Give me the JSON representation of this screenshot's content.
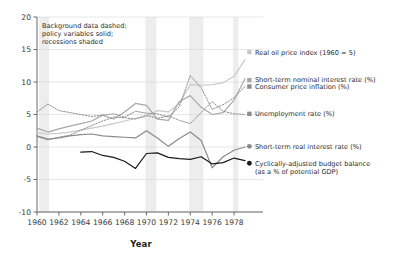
{
  "chart_data": {
    "type": "line",
    "title": "",
    "xlabel": "Year",
    "ylabel": "",
    "xlim": [
      1960,
      1979
    ],
    "ylim": [
      -10,
      20
    ],
    "xticks": [
      1960,
      1962,
      1964,
      1966,
      1968,
      1970,
      1972,
      1974,
      1976,
      1978
    ],
    "yticks": [
      -10,
      -5,
      0,
      5,
      10,
      15,
      20
    ],
    "grid": true,
    "legend_position": "right",
    "annotation": "Background data dashed; policy variables solid; recessions shaded",
    "annotation_lines": [
      "Background data dashed;",
      "policy variables solid;",
      "recessions shaded"
    ],
    "recessions": [
      {
        "start": 1960.2,
        "end": 1961.1
      },
      {
        "start": 1969.9,
        "end": 1970.9
      },
      {
        "start": 1973.9,
        "end": 1975.2
      },
      {
        "start": 1977.9,
        "end": 1978.4
      }
    ],
    "x": [
      1960,
      1961,
      1962,
      1963,
      1964,
      1965,
      1966,
      1967,
      1968,
      1969,
      1970,
      1971,
      1972,
      1973,
      1974,
      1975,
      1976,
      1977,
      1978,
      1979
    ],
    "series": [
      {
        "name": "Real oil price index (1960 = 5)",
        "key": "oil",
        "style": "solid",
        "color": "#c9c9c9",
        "marker": "square",
        "label_x": 1979.4,
        "label_y": 14.6,
        "values": [
          2.2,
          2.0,
          2.1,
          2.3,
          2.6,
          2.9,
          3.2,
          3.6,
          4.0,
          4.4,
          4.7,
          5.6,
          5.4,
          6.7,
          9.6,
          9.5,
          9.6,
          9.9,
          10.9,
          13.4
        ]
      },
      {
        "name": "Short-term nominal interest rate (%)",
        "key": "nominal_rate",
        "style": "solid",
        "color": "#a8a8a8",
        "marker": "square",
        "label_x": 1979.4,
        "label_y": 10.3,
        "values": [
          2.9,
          2.3,
          2.8,
          3.2,
          3.6,
          4.0,
          4.9,
          4.3,
          5.4,
          6.7,
          6.4,
          4.3,
          4.1,
          7.0,
          7.9,
          6.1,
          5.0,
          5.3,
          7.2,
          10.5
        ]
      },
      {
        "name": "Consumer price inflation (%)",
        "key": "cpi",
        "style": "dashed",
        "color": "#8c8c8c",
        "marker": "square",
        "label_x": 1979.4,
        "label_y": 9.3,
        "values": [
          5.4,
          6.6,
          5.6,
          5.3,
          5.0,
          4.7,
          4.9,
          5.1,
          4.6,
          5.5,
          5.2,
          5.1,
          4.6,
          6.2,
          11.0,
          9.1,
          5.8,
          6.5,
          7.6,
          9.3
        ]
      },
      {
        "name": "Unemployment rate (%)",
        "key": "unemployment",
        "style": "dashed",
        "color": "#8c8c8c",
        "marker": "square",
        "label_x": 1979.4,
        "label_y": 5.1,
        "values": [
          1.6,
          1.1,
          1.5,
          1.8,
          2.6,
          3.3,
          4.0,
          4.6,
          4.5,
          4.3,
          4.9,
          4.4,
          4.8,
          4.1,
          3.6,
          5.3,
          7.0,
          5.5,
          5.1,
          5.0
        ]
      },
      {
        "name": "Short-term real interest rate (%)",
        "key": "real_rate",
        "style": "solid",
        "color": "#8a8a8a",
        "marker": "circle",
        "label_x": 1979.4,
        "label_y": 0.1,
        "values": [
          1.7,
          1.2,
          1.4,
          1.7,
          1.9,
          2.0,
          1.7,
          1.6,
          1.5,
          1.4,
          2.5,
          1.4,
          0.1,
          1.3,
          2.3,
          1.0,
          -3.2,
          -1.5,
          -0.5,
          0.0
        ]
      },
      {
        "name": "Cyclically-adjusted budget balance (as a % of potential GDP)",
        "key": "budget_balance",
        "style": "solid",
        "color": "#1a1a1a",
        "marker": "circle",
        "label_x": 1979.4,
        "label_y": -2.5,
        "label_lines": [
          "Cyclically-adjusted budget balance",
          "(as a % of potential GDP)"
        ],
        "values": [
          null,
          null,
          null,
          null,
          -0.8,
          -0.7,
          -1.3,
          -1.6,
          -2.2,
          -3.3,
          -1.0,
          -0.9,
          -1.6,
          -1.8,
          -1.9,
          -1.5,
          -2.6,
          -2.4,
          -1.7,
          -2.1
        ]
      }
    ]
  }
}
